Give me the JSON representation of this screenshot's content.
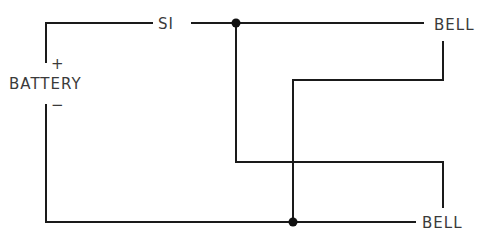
{
  "diagram": {
    "type": "circuit-wiring",
    "labels": {
      "switch": "SI",
      "battery": "BATTERY",
      "battery_positive": "+",
      "battery_negative": "−",
      "bell_top": "BELL",
      "bell_bottom": "BELL"
    },
    "components": [
      {
        "id": "battery",
        "label": "BATTERY"
      },
      {
        "id": "switch",
        "label": "SI"
      },
      {
        "id": "bell-1",
        "label": "BELL"
      },
      {
        "id": "bell-2",
        "label": "BELL"
      }
    ],
    "junctions": 2,
    "colors": {
      "wire": "#1a1a1a",
      "text": "#3a3a3a",
      "background": "#ffffff"
    }
  }
}
